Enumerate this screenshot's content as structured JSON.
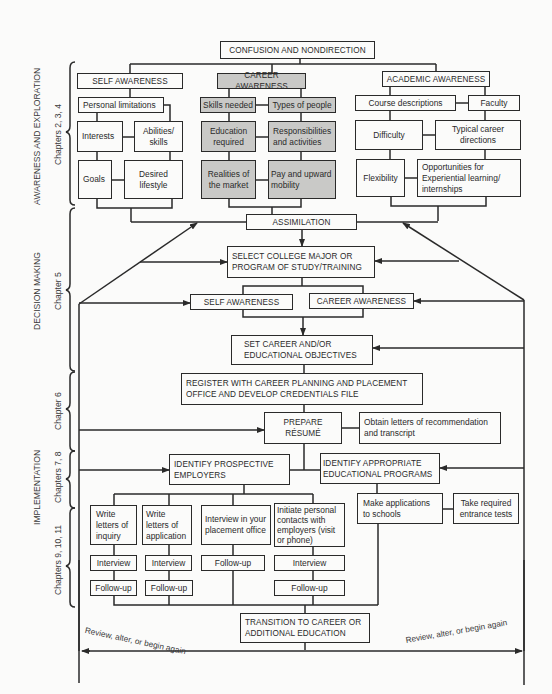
{
  "diagram": {
    "title": "CONFUSION AND NONDIRECTION",
    "phases": [
      {
        "name": "AWARENESS AND EXPLORATION",
        "chapters": "Chapters 2, 3, 4"
      },
      {
        "name": "DECISION MAKING",
        "chapters": "Chapter 5"
      },
      {
        "name": "IMPLEMENTATION",
        "chapters_6": "Chapter 6",
        "chapters_78": "Chapters 7, 8",
        "chapters_911": "Chapters 9, 10, 11"
      }
    ],
    "awareness": {
      "self": {
        "title": "SELF AWARENESS",
        "personal_limitations": "Personal limitations",
        "interests": "Interests",
        "abilities": "Abilities/ skills",
        "goals": "Goals",
        "desired_lifestyle": "Desired lifestyle"
      },
      "career": {
        "title": "CAREER AWARENESS",
        "skills_needed": "Skills needed",
        "types_of_people": "Types of people",
        "education_required": "Education required",
        "responsibilities": "Responsibilities and activities",
        "realities": "Realities of the market",
        "pay": "Pay and upward mobility"
      },
      "academic": {
        "title": "ACADEMIC AWARENESS",
        "course_descriptions": "Course descriptions",
        "faculty": "Faculty",
        "difficulty": "Difficulty",
        "typical_career": "Typical career directions",
        "flexibility": "Flexibility",
        "opportunities": "Opportunities for Experiential learning/ internships"
      }
    },
    "decision": {
      "assimilation": "ASSIMILATION",
      "select_major": "SELECT COLLEGE MAJOR OR PROGRAM OF STUDY/TRAINING",
      "self_awareness": "SELF AWARENESS",
      "career_awareness": "CAREER AWARENESS",
      "set_objectives": "SET CAREER AND/OR EDUCATIONAL OBJECTIVES"
    },
    "implementation": {
      "register": "REGISTER WITH CAREER PLANNING AND PLACEMENT OFFICE AND DEVELOP CREDENTIALS FILE",
      "prepare_resume": "PREPARE RÉSUMÉ",
      "obtain_letters": "Obtain letters of recommendation and transcript",
      "identify_employers": "IDENTIFY PROSPECTIVE EMPLOYERS",
      "identify_programs": "IDENTIFY APPROPRIATE EDUCATIONAL PROGRAMS",
      "write_inquiry": "Write letters of inquiry",
      "write_application": "Write letters of application",
      "interview_placement": "Interview in your placement office",
      "initiate_contacts": "Initiate personal contacts with employers (visit or phone)",
      "make_applications": "Make applications to schools",
      "take_tests": "Take required entrance tests",
      "interview": "Interview",
      "follow_up": "Follow-up",
      "transition": "TRANSITION TO CAREER OR ADDITIONAL EDUCATION"
    },
    "review_text": "Review, alter, or begin again",
    "colors": {
      "line": "#2a2a2a",
      "gray_fill": "#c9c9c7",
      "background": "#fbfbfa"
    }
  }
}
